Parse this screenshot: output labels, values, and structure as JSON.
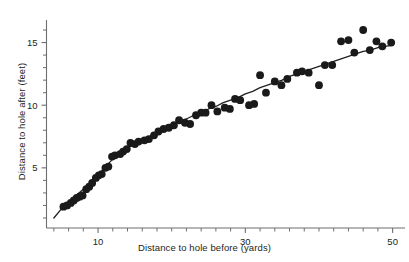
{
  "chart_data": {
    "type": "scatter",
    "title": "",
    "xlabel": "Distance to hole before (yards)",
    "ylabel": "Distance to hole after (feet)",
    "xlim": [
      3,
      51
    ],
    "ylim": [
      0.2,
      16.8
    ],
    "grid": false,
    "legend": null,
    "x_major_ticks": [
      10,
      30,
      50
    ],
    "x_major_tick_labels": [
      "10",
      "30",
      "50"
    ],
    "x_minor_ticks": [
      4,
      6,
      8,
      12,
      14,
      16,
      18,
      20,
      22,
      24,
      26,
      28,
      32,
      34,
      36,
      38,
      40,
      42,
      44,
      46,
      48
    ],
    "y_major_ticks": [
      5,
      10,
      15
    ],
    "y_major_tick_labels": [
      "5",
      "10",
      "15"
    ],
    "y_minor_ticks": [
      1,
      2,
      3,
      4,
      6,
      7,
      8,
      9,
      11,
      12,
      13,
      14,
      16
    ],
    "marker": {
      "shape": "circle",
      "color": "#1a1a1a",
      "radius_px": 3.9
    },
    "points": [
      {
        "x": 5.3,
        "y": 1.9
      },
      {
        "x": 5.8,
        "y": 2.0
      },
      {
        "x": 6.3,
        "y": 2.2
      },
      {
        "x": 6.7,
        "y": 2.4
      },
      {
        "x": 7.1,
        "y": 2.6
      },
      {
        "x": 7.5,
        "y": 2.7
      },
      {
        "x": 7.9,
        "y": 2.8
      },
      {
        "x": 8.4,
        "y": 3.3
      },
      {
        "x": 8.8,
        "y": 3.5
      },
      {
        "x": 9.2,
        "y": 3.8
      },
      {
        "x": 9.7,
        "y": 4.2
      },
      {
        "x": 10.1,
        "y": 4.4
      },
      {
        "x": 10.5,
        "y": 4.5
      },
      {
        "x": 11.0,
        "y": 5.0
      },
      {
        "x": 11.4,
        "y": 5.1
      },
      {
        "x": 11.9,
        "y": 5.9
      },
      {
        "x": 12.3,
        "y": 6.0
      },
      {
        "x": 13.0,
        "y": 6.1
      },
      {
        "x": 13.4,
        "y": 6.3
      },
      {
        "x": 13.9,
        "y": 6.5
      },
      {
        "x": 14.4,
        "y": 7.0
      },
      {
        "x": 15.0,
        "y": 6.9
      },
      {
        "x": 15.5,
        "y": 7.1
      },
      {
        "x": 16.3,
        "y": 7.2
      },
      {
        "x": 16.9,
        "y": 7.3
      },
      {
        "x": 17.6,
        "y": 7.6
      },
      {
        "x": 18.2,
        "y": 7.9
      },
      {
        "x": 18.9,
        "y": 8.1
      },
      {
        "x": 19.6,
        "y": 8.2
      },
      {
        "x": 20.3,
        "y": 8.4
      },
      {
        "x": 21.0,
        "y": 8.8
      },
      {
        "x": 21.8,
        "y": 8.6
      },
      {
        "x": 22.5,
        "y": 8.5
      },
      {
        "x": 23.3,
        "y": 9.2
      },
      {
        "x": 24.0,
        "y": 9.4
      },
      {
        "x": 24.6,
        "y": 9.4
      },
      {
        "x": 25.4,
        "y": 10.0
      },
      {
        "x": 26.2,
        "y": 9.5
      },
      {
        "x": 27.2,
        "y": 9.8
      },
      {
        "x": 27.9,
        "y": 9.7
      },
      {
        "x": 28.6,
        "y": 10.5
      },
      {
        "x": 29.3,
        "y": 10.4
      },
      {
        "x": 30.5,
        "y": 10.0
      },
      {
        "x": 31.2,
        "y": 10.1
      },
      {
        "x": 32.0,
        "y": 12.4
      },
      {
        "x": 32.8,
        "y": 11.0
      },
      {
        "x": 34.0,
        "y": 11.9
      },
      {
        "x": 34.9,
        "y": 11.6
      },
      {
        "x": 35.7,
        "y": 12.1
      },
      {
        "x": 37.0,
        "y": 12.6
      },
      {
        "x": 37.7,
        "y": 12.7
      },
      {
        "x": 38.6,
        "y": 12.6
      },
      {
        "x": 40.0,
        "y": 11.6
      },
      {
        "x": 40.8,
        "y": 13.2
      },
      {
        "x": 41.8,
        "y": 13.2
      },
      {
        "x": 43.0,
        "y": 15.1
      },
      {
        "x": 44.0,
        "y": 15.2
      },
      {
        "x": 44.8,
        "y": 14.2
      },
      {
        "x": 46.0,
        "y": 16.0
      },
      {
        "x": 46.9,
        "y": 14.4
      },
      {
        "x": 47.8,
        "y": 15.1
      },
      {
        "x": 48.6,
        "y": 14.7
      },
      {
        "x": 49.8,
        "y": 15.0
      }
    ],
    "fit_curve": {
      "name": "smoothed trend line",
      "color": "#231f20",
      "points": [
        {
          "x": 4.0,
          "y": 1.0
        },
        {
          "x": 5.0,
          "y": 1.7
        },
        {
          "x": 6.0,
          "y": 2.3
        },
        {
          "x": 7.0,
          "y": 2.8
        },
        {
          "x": 8.0,
          "y": 3.3
        },
        {
          "x": 9.0,
          "y": 3.8
        },
        {
          "x": 10.0,
          "y": 4.4
        },
        {
          "x": 11.0,
          "y": 5.1
        },
        {
          "x": 12.0,
          "y": 5.7
        },
        {
          "x": 13.0,
          "y": 6.2
        },
        {
          "x": 14.0,
          "y": 6.6
        },
        {
          "x": 15.0,
          "y": 6.9
        },
        {
          "x": 16.0,
          "y": 7.2
        },
        {
          "x": 17.0,
          "y": 7.5
        },
        {
          "x": 18.0,
          "y": 7.8
        },
        {
          "x": 19.0,
          "y": 8.1
        },
        {
          "x": 20.0,
          "y": 8.4
        },
        {
          "x": 21.0,
          "y": 8.7
        },
        {
          "x": 22.0,
          "y": 8.9
        },
        {
          "x": 23.0,
          "y": 9.2
        },
        {
          "x": 24.0,
          "y": 9.4
        },
        {
          "x": 25.0,
          "y": 9.7
        },
        {
          "x": 26.0,
          "y": 9.9
        },
        {
          "x": 27.0,
          "y": 10.2
        },
        {
          "x": 28.0,
          "y": 10.4
        },
        {
          "x": 29.0,
          "y": 10.6
        },
        {
          "x": 30.0,
          "y": 10.9
        },
        {
          "x": 31.0,
          "y": 11.1
        },
        {
          "x": 32.0,
          "y": 11.4
        },
        {
          "x": 33.0,
          "y": 11.6
        },
        {
          "x": 34.0,
          "y": 11.8
        },
        {
          "x": 35.0,
          "y": 12.0
        },
        {
          "x": 36.0,
          "y": 12.3
        },
        {
          "x": 37.0,
          "y": 12.5
        },
        {
          "x": 38.0,
          "y": 12.7
        },
        {
          "x": 39.0,
          "y": 12.9
        },
        {
          "x": 40.0,
          "y": 13.1
        },
        {
          "x": 41.0,
          "y": 13.3
        },
        {
          "x": 42.0,
          "y": 13.5
        },
        {
          "x": 43.0,
          "y": 13.7
        },
        {
          "x": 44.0,
          "y": 13.9
        },
        {
          "x": 45.0,
          "y": 14.1
        },
        {
          "x": 46.0,
          "y": 14.3
        },
        {
          "x": 47.0,
          "y": 14.4
        },
        {
          "x": 48.0,
          "y": 14.6
        },
        {
          "x": 49.0,
          "y": 14.7
        },
        {
          "x": 50.0,
          "y": 14.8
        }
      ]
    }
  }
}
